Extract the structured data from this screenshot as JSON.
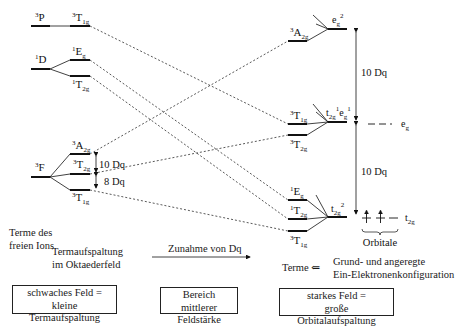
{
  "diagram": {
    "free_ion_terms": [
      {
        "term": "3P",
        "sup": "3",
        "base": "P",
        "sub": ""
      },
      {
        "term": "1D",
        "sup": "1",
        "base": "D",
        "sub": ""
      },
      {
        "term": "3F",
        "sup": "3",
        "base": "F",
        "sub": ""
      }
    ],
    "weak_field_levels": [
      {
        "sup": "3",
        "base": "T",
        "sub": "1g"
      },
      {
        "sup": "1",
        "base": "E",
        "sub": "g"
      },
      {
        "sup": "1",
        "base": "T",
        "sub": "2g"
      },
      {
        "sup": "3",
        "base": "A",
        "sub": "2g"
      },
      {
        "sup": "3",
        "base": "T",
        "sub": "2g"
      },
      {
        "sup": "3",
        "base": "T",
        "sub": "1g"
      }
    ],
    "weak_field_splitting": {
      "upper": "10 Dq",
      "lower": "8 Dq"
    },
    "strong_field_levels": [
      {
        "sup": "3",
        "base": "A",
        "sub": "2g"
      },
      {
        "sup": "3",
        "base": "T",
        "sub": "1g"
      },
      {
        "sup": "3",
        "base": "T",
        "sub": "2g"
      },
      {
        "sup": "1",
        "base": "E",
        "sub": "g"
      },
      {
        "sup": "1",
        "base": "T",
        "sub": "2g"
      },
      {
        "sup": "3",
        "base": "T",
        "sub": "1g"
      }
    ],
    "configurations": [
      {
        "label": "eg2",
        "parts": [
          {
            "base": "e",
            "sub": "g",
            "sup": "2"
          }
        ]
      },
      {
        "label": "t2g1eg1",
        "parts": [
          {
            "base": "t",
            "sub": "2g",
            "sup": "1"
          },
          {
            "base": "e",
            "sub": "g",
            "sup": "1"
          }
        ]
      },
      {
        "label": "t2g2",
        "parts": [
          {
            "base": "t",
            "sub": "2g",
            "sup": "2"
          }
        ]
      }
    ],
    "strong_field_splitting": {
      "upper": "10 Dq",
      "lower": "10 Dq"
    },
    "orbitals": {
      "eg": {
        "base": "e",
        "sub": "g"
      },
      "t2g": {
        "base": "t",
        "sub": "2g"
      },
      "label": "Orbitale"
    },
    "texts": {
      "free_ion_l1": "Terme des",
      "free_ion_l2": "freien Ions",
      "splitting_l1": "Termaufspaltung",
      "splitting_l2": "im Oktaederfeld",
      "increase": "Zunahme von Dq",
      "terme_arrow": "Terme ⇐",
      "config_l1": "Grund- und angeregte",
      "config_l2": "Ein-Elektronenkonfiguration"
    },
    "boxes": {
      "weak_l1": "schwaches Feld =",
      "weak_l2": "kleine Termaufspaltung",
      "mid_l1": "Bereich mittlerer",
      "mid_l2": "Feldstärke",
      "strong_l1": "starkes Feld =",
      "strong_l2": "große Orbitalaufspaltung"
    }
  }
}
